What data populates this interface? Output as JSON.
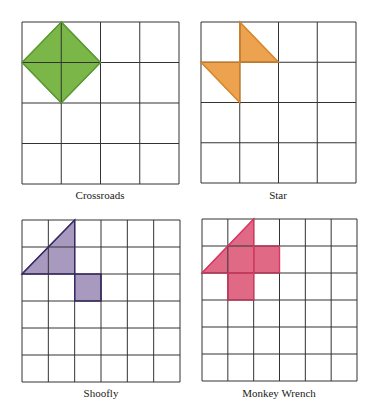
{
  "figure": {
    "panels": [
      {
        "name": "Crossroads",
        "grid": {
          "rows": 4,
          "cols": 4,
          "x": 22,
          "y": 22,
          "w": 157,
          "h": 162
        },
        "fill": "#7ab648",
        "stroke": "#5a9a32",
        "shapes": [
          {
            "type": "polygon",
            "points": [
              [
                1,
                0
              ],
              [
                2,
                1
              ],
              [
                1,
                2
              ],
              [
                0,
                1
              ]
            ]
          }
        ],
        "caption": {
          "x": 100,
          "y": 189
        }
      },
      {
        "name": "Star",
        "grid": {
          "rows": 4,
          "cols": 4,
          "x": 201,
          "y": 22,
          "w": 155,
          "h": 161
        },
        "fill": "#eca24e",
        "stroke": "#d98a2c",
        "shapes": [
          {
            "type": "polygon",
            "points": [
              [
                1,
                0
              ],
              [
                2,
                1
              ],
              [
                1,
                1
              ]
            ]
          },
          {
            "type": "polygon",
            "points": [
              [
                0,
                1
              ],
              [
                1,
                1
              ],
              [
                1,
                2
              ]
            ]
          }
        ],
        "caption": {
          "x": 278,
          "y": 189
        }
      },
      {
        "name": "Shoofly",
        "grid": {
          "rows": 6,
          "cols": 6,
          "x": 22,
          "y": 220,
          "w": 158,
          "h": 162
        },
        "fill": "#a899be",
        "stroke": "#3a2a6a",
        "shapes": [
          {
            "type": "polygon",
            "points": [
              [
                2,
                0
              ],
              [
                2,
                2
              ],
              [
                0,
                2
              ]
            ]
          },
          {
            "type": "polygon",
            "points": [
              [
                2,
                2
              ],
              [
                3,
                2
              ],
              [
                3,
                3
              ],
              [
                2,
                3
              ]
            ]
          }
        ],
        "caption": {
          "x": 101,
          "y": 387
        }
      },
      {
        "name": "Monkey Wrench",
        "grid": {
          "rows": 6,
          "cols": 6,
          "x": 202,
          "y": 219,
          "w": 155,
          "h": 162
        },
        "fill": "#e06a86",
        "stroke": "#d83a64",
        "shapes": [
          {
            "type": "polygon",
            "points": [
              [
                2,
                0
              ],
              [
                2,
                2
              ],
              [
                0,
                2
              ]
            ]
          },
          {
            "type": "polygon",
            "points": [
              [
                2,
                1
              ],
              [
                3,
                1
              ],
              [
                3,
                2
              ],
              [
                2,
                2
              ]
            ]
          },
          {
            "type": "polygon",
            "points": [
              [
                1,
                2
              ],
              [
                2,
                2
              ],
              [
                2,
                3
              ],
              [
                1,
                3
              ]
            ]
          }
        ],
        "caption": {
          "x": 279,
          "y": 387
        }
      }
    ],
    "grid_line_color": "#333333"
  }
}
